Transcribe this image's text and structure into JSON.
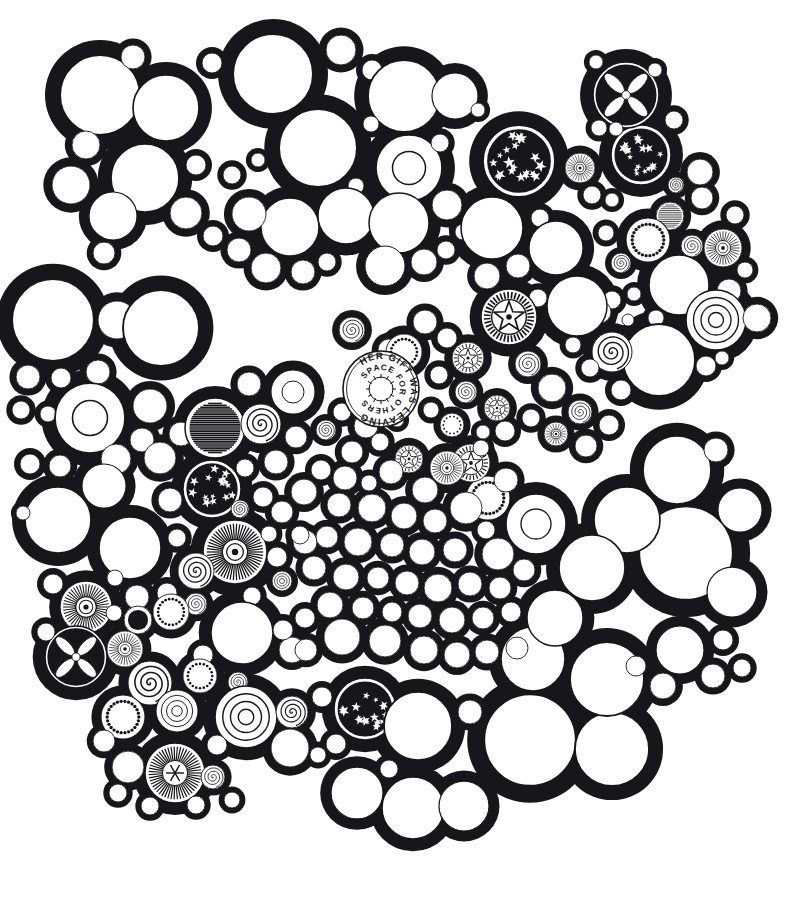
{
  "artwork": {
    "title": "Circle Packing Ink Drawing",
    "medium": "pen-and-ink",
    "background_color": "#ffffff",
    "ink_color": "#17161a",
    "canvas": {
      "width": 785,
      "height": 923
    },
    "hidden_text": {
      "outer_ring": "HER GIFT WAS LEAVING",
      "inner_ring": "SPACE FOR OTHERS",
      "full_phrase": "HER GIFT WAS LEAVING SPACE FOR OTHERS",
      "center_x": 381,
      "center_y": 389,
      "outer_radius": 30,
      "inner_radius": 19
    },
    "motif_names": [
      "plain-circle",
      "double-ring-circle",
      "concentric-rings",
      "spiral",
      "radial-sunburst",
      "star-field-circle",
      "flower-rosette",
      "five-point-star-medallion",
      "dotted-ring",
      "stippled-ring",
      "solid-black-disc",
      "asterisk-glyph",
      "hatched-circle"
    ]
  },
  "chart_data": {
    "type": "scatter",
    "xlabel": "",
    "ylabel": "",
    "xlim": [
      0,
      785
    ],
    "ylim": [
      0,
      923
    ],
    "grid": false,
    "legend": null,
    "note": "Each point is a packed circle: cx, cy, r in pixels, plus its decorative motif.",
    "fields": [
      "cx",
      "cy",
      "r",
      "motif"
    ],
    "circles": [
      [
        100,
        95,
        40,
        "plain"
      ],
      [
        166,
        108,
        33,
        "plain"
      ],
      [
        133,
        57,
        12,
        "plain"
      ],
      [
        212,
        63,
        10,
        "plain"
      ],
      [
        86,
        145,
        14,
        "plain"
      ],
      [
        145,
        178,
        34,
        "plain"
      ],
      [
        196,
        165,
        10,
        "plain"
      ],
      [
        71,
        185,
        19,
        "plain"
      ],
      [
        113,
        216,
        24,
        "plain"
      ],
      [
        186,
        213,
        16,
        "plain"
      ],
      [
        104,
        253,
        11,
        "plain"
      ],
      [
        273,
        74,
        40,
        "plain"
      ],
      [
        341,
        50,
        15,
        "plain"
      ],
      [
        318,
        148,
        39,
        "plain"
      ],
      [
        372,
        70,
        10,
        "plain"
      ],
      [
        404,
        96,
        36,
        "plain"
      ],
      [
        371,
        124,
        8,
        "plain"
      ],
      [
        409,
        168,
        33,
        "double"
      ],
      [
        455,
        96,
        23,
        "plain"
      ],
      [
        440,
        143,
        9,
        "plain"
      ],
      [
        478,
        110,
        7,
        "plain"
      ],
      [
        356,
        186,
        8,
        "plain"
      ],
      [
        290,
        227,
        29,
        "plain"
      ],
      [
        346,
        216,
        28,
        "plain"
      ],
      [
        249,
        214,
        17,
        "plain"
      ],
      [
        232,
        175,
        9,
        "plain"
      ],
      [
        258,
        160,
        7,
        "plain"
      ],
      [
        239,
        250,
        12,
        "plain"
      ],
      [
        213,
        236,
        10,
        "plain"
      ],
      [
        266,
        268,
        15,
        "plain"
      ],
      [
        303,
        272,
        12,
        "plain"
      ],
      [
        327,
        262,
        9,
        "plain"
      ],
      [
        399,
        223,
        30,
        "plain"
      ],
      [
        447,
        205,
        15,
        "plain"
      ],
      [
        385,
        266,
        20,
        "plain"
      ],
      [
        424,
        262,
        13,
        "plain"
      ],
      [
        446,
        250,
        9,
        "plain"
      ],
      [
        463,
        232,
        8,
        "plain"
      ],
      [
        492,
        228,
        31,
        "plain"
      ],
      [
        540,
        218,
        9,
        "plain"
      ],
      [
        556,
        248,
        27,
        "plain"
      ],
      [
        518,
        266,
        12,
        "plain"
      ],
      [
        487,
        276,
        13,
        "plain"
      ],
      [
        519,
        161,
        36,
        "star-field"
      ],
      [
        580,
        168,
        15,
        "radial-burst"
      ],
      [
        641,
        155,
        30,
        "star-field"
      ],
      [
        626,
        95,
        33,
        "flower-rosette"
      ],
      [
        599,
        128,
        8,
        "plain"
      ],
      [
        616,
        129,
        7,
        "plain"
      ],
      [
        674,
        120,
        9,
        "plain"
      ],
      [
        596,
        62,
        7,
        "plain"
      ],
      [
        655,
        70,
        7,
        "plain"
      ],
      [
        592,
        195,
        9,
        "plain"
      ],
      [
        612,
        200,
        7,
        "plain"
      ],
      [
        676,
        185,
        8,
        "spiral"
      ],
      [
        700,
        172,
        13,
        "plain"
      ],
      [
        702,
        198,
        11,
        "plain"
      ],
      [
        670,
        216,
        14,
        "hatched"
      ],
      [
        648,
        240,
        22,
        "dotted-ring"
      ],
      [
        692,
        246,
        11,
        "spiral"
      ],
      [
        723,
        248,
        19,
        "radial-burst"
      ],
      [
        735,
        215,
        9,
        "plain"
      ],
      [
        606,
        233,
        8,
        "plain"
      ],
      [
        621,
        263,
        10,
        "spiral"
      ],
      [
        679,
        285,
        30,
        "plain"
      ],
      [
        729,
        291,
        12,
        "plain"
      ],
      [
        745,
        270,
        8,
        "plain"
      ],
      [
        716,
        320,
        30,
        "concentric"
      ],
      [
        757,
        318,
        14,
        "plain"
      ],
      [
        612,
        300,
        9,
        "plain"
      ],
      [
        634,
        294,
        7,
        "plain"
      ],
      [
        656,
        318,
        8,
        "plain"
      ],
      [
        600,
        312,
        11,
        "plain"
      ],
      [
        628,
        320,
        6,
        "plain"
      ],
      [
        577,
        306,
        30,
        "plain"
      ],
      [
        538,
        298,
        9,
        "plain"
      ],
      [
        659,
        360,
        36,
        "plain"
      ],
      [
        706,
        366,
        10,
        "plain"
      ],
      [
        722,
        358,
        7,
        "plain"
      ],
      [
        612,
        352,
        20,
        "spiral"
      ],
      [
        621,
        390,
        10,
        "plain"
      ],
      [
        590,
        368,
        9,
        "plain"
      ],
      [
        573,
        345,
        8,
        "plain"
      ],
      [
        53,
        320,
        41,
        "plain"
      ],
      [
        117,
        320,
        19,
        "plain"
      ],
      [
        28,
        377,
        12,
        "plain"
      ],
      [
        61,
        378,
        10,
        "plain"
      ],
      [
        98,
        372,
        12,
        "plain"
      ],
      [
        161,
        328,
        38,
        "plain"
      ],
      [
        21,
        410,
        9,
        "plain"
      ],
      [
        48,
        414,
        8,
        "plain"
      ],
      [
        90,
        418,
        35,
        "double"
      ],
      [
        150,
        406,
        17,
        "plain"
      ],
      [
        142,
        440,
        12,
        "plain"
      ],
      [
        116,
        459,
        15,
        "plain"
      ],
      [
        30,
        464,
        10,
        "plain"
      ],
      [
        60,
        466,
        11,
        "plain"
      ],
      [
        58,
        520,
        33,
        "plain"
      ],
      [
        104,
        486,
        22,
        "plain"
      ],
      [
        23,
        513,
        7,
        "plain"
      ],
      [
        160,
        458,
        16,
        "plain"
      ],
      [
        181,
        434,
        12,
        "plain"
      ],
      [
        215,
        428,
        30,
        "hatched"
      ],
      [
        261,
        424,
        20,
        "spiral"
      ],
      [
        293,
        392,
        22,
        "double"
      ],
      [
        249,
        384,
        12,
        "plain"
      ],
      [
        296,
        437,
        11,
        "plain"
      ],
      [
        276,
        462,
        12,
        "plain"
      ],
      [
        245,
        468,
        9,
        "plain"
      ],
      [
        212,
        489,
        29,
        "star-field"
      ],
      [
        170,
        500,
        12,
        "plain"
      ],
      [
        263,
        497,
        10,
        "plain"
      ],
      [
        240,
        509,
        9,
        "spiral"
      ],
      [
        130,
        548,
        31,
        "plain"
      ],
      [
        177,
        538,
        9,
        "plain"
      ],
      [
        235,
        552,
        32,
        "radial-burst"
      ],
      [
        196,
        571,
        18,
        "spiral"
      ],
      [
        167,
        593,
        10,
        "plain"
      ],
      [
        196,
        604,
        11,
        "spiral"
      ],
      [
        277,
        557,
        10,
        "plain"
      ],
      [
        282,
        581,
        10,
        "concentric"
      ],
      [
        305,
        542,
        12,
        "plain"
      ],
      [
        252,
        596,
        9,
        "plain"
      ],
      [
        86,
        607,
        26,
        "radial-burst"
      ],
      [
        137,
        597,
        12,
        "plain"
      ],
      [
        138,
        620,
        14,
        "solid-black"
      ],
      [
        171,
        612,
        18,
        "dotted-ring"
      ],
      [
        53,
        584,
        10,
        "plain"
      ],
      [
        115,
        578,
        8,
        "plain"
      ],
      [
        76,
        657,
        31,
        "flower-rosette"
      ],
      [
        125,
        649,
        18,
        "radial-burst"
      ],
      [
        46,
        632,
        9,
        "plain"
      ],
      [
        114,
        613,
        8,
        "plain"
      ],
      [
        242,
        633,
        31,
        "plain"
      ],
      [
        292,
        650,
        13,
        "plain"
      ],
      [
        203,
        655,
        10,
        "plain"
      ],
      [
        150,
        683,
        22,
        "spiral"
      ],
      [
        200,
        676,
        17,
        "dotted-ring"
      ],
      [
        238,
        682,
        10,
        "spiral"
      ],
      [
        123,
        717,
        22,
        "dotted-ring"
      ],
      [
        177,
        711,
        21,
        "concentric"
      ],
      [
        246,
        717,
        31,
        "concentric"
      ],
      [
        292,
        712,
        16,
        "spiral"
      ],
      [
        290,
        748,
        19,
        "plain"
      ],
      [
        217,
        745,
        10,
        "plain"
      ],
      [
        175,
        773,
        30,
        "asterisk"
      ],
      [
        128,
        767,
        16,
        "plain"
      ],
      [
        104,
        741,
        11,
        "plain"
      ],
      [
        213,
        777,
        12,
        "spiral"
      ],
      [
        150,
        806,
        9,
        "plain"
      ],
      [
        196,
        805,
        9,
        "plain"
      ],
      [
        232,
        800,
        8,
        "plain"
      ],
      [
        118,
        793,
        9,
        "plain"
      ],
      [
        365,
        709,
        31,
        "star-field"
      ],
      [
        322,
        697,
        10,
        "plain"
      ],
      [
        336,
        744,
        10,
        "plain"
      ],
      [
        318,
        755,
        8,
        "plain"
      ],
      [
        418,
        726,
        34,
        "plain"
      ],
      [
        470,
        712,
        12,
        "plain"
      ],
      [
        357,
        793,
        26,
        "plain"
      ],
      [
        413,
        808,
        31,
        "plain"
      ],
      [
        464,
        806,
        25,
        "plain"
      ],
      [
        389,
        769,
        9,
        "plain"
      ],
      [
        530,
        740,
        46,
        "plain"
      ],
      [
        612,
        749,
        37,
        "plain"
      ],
      [
        607,
        679,
        37,
        "plain"
      ],
      [
        533,
        659,
        32,
        "plain"
      ],
      [
        680,
        650,
        24,
        "plain"
      ],
      [
        723,
        640,
        10,
        "plain"
      ],
      [
        742,
        668,
        9,
        "plain"
      ],
      [
        713,
        676,
        12,
        "plain"
      ],
      [
        663,
        686,
        13,
        "plain"
      ],
      [
        636,
        666,
        10,
        "plain"
      ],
      [
        686,
        553,
        47,
        "plain"
      ],
      [
        740,
        510,
        22,
        "plain"
      ],
      [
        732,
        592,
        25,
        "plain"
      ],
      [
        677,
        470,
        34,
        "plain"
      ],
      [
        627,
        520,
        33,
        "plain"
      ],
      [
        716,
        450,
        12,
        "plain"
      ],
      [
        592,
        568,
        33,
        "plain"
      ],
      [
        555,
        618,
        28,
        "plain"
      ],
      [
        536,
        524,
        30,
        "double"
      ],
      [
        488,
        498,
        22,
        "dotted-ring"
      ],
      [
        498,
        554,
        16,
        "plain"
      ],
      [
        471,
        463,
        19,
        "star-medallion"
      ],
      [
        509,
        317,
        28,
        "star-medallion"
      ],
      [
        468,
        358,
        16,
        "star-medallion"
      ],
      [
        497,
        408,
        13,
        "star-medallion"
      ],
      [
        409,
        459,
        14,
        "star-medallion"
      ],
      [
        389,
        350,
        11,
        "plain"
      ],
      [
        352,
        330,
        13,
        "spiral"
      ],
      [
        404,
        352,
        18,
        "dotted-ring"
      ],
      [
        425,
        322,
        12,
        "plain"
      ],
      [
        447,
        338,
        10,
        "plain"
      ],
      [
        439,
        375,
        9,
        "plain"
      ],
      [
        466,
        392,
        11,
        "spiral"
      ],
      [
        528,
        364,
        13,
        "spiral"
      ],
      [
        552,
        388,
        14,
        "plain"
      ],
      [
        580,
        412,
        12,
        "spiral"
      ],
      [
        609,
        425,
        10,
        "plain"
      ],
      [
        586,
        446,
        11,
        "plain"
      ],
      [
        556,
        434,
        12,
        "radial-burst"
      ],
      [
        531,
        418,
        9,
        "plain"
      ],
      [
        505,
        431,
        10,
        "plain"
      ],
      [
        483,
        432,
        7,
        "plain"
      ],
      [
        452,
        425,
        12,
        "dotted-ring"
      ],
      [
        431,
        410,
        8,
        "plain"
      ],
      [
        366,
        426,
        12,
        "plain"
      ],
      [
        342,
        412,
        9,
        "plain"
      ],
      [
        326,
        430,
        10,
        "spiral"
      ],
      [
        352,
        452,
        11,
        "plain"
      ],
      [
        380,
        442,
        9,
        "plain"
      ],
      [
        397,
        420,
        7,
        "plain"
      ],
      [
        447,
        468,
        17,
        "radial-burst"
      ],
      [
        425,
        490,
        13,
        "plain"
      ],
      [
        481,
        448,
        8,
        "plain"
      ],
      [
        391,
        472,
        12,
        "plain"
      ],
      [
        369,
        483,
        8,
        "plain"
      ],
      [
        345,
        478,
        12,
        "plain"
      ],
      [
        321,
        470,
        10,
        "plain"
      ],
      [
        304,
        492,
        13,
        "plain"
      ],
      [
        339,
        505,
        12,
        "plain"
      ],
      [
        372,
        508,
        14,
        "plain"
      ],
      [
        404,
        516,
        13,
        "plain"
      ],
      [
        435,
        521,
        12,
        "plain"
      ],
      [
        466,
        508,
        16,
        "plain"
      ],
      [
        506,
        480,
        12,
        "plain"
      ],
      [
        282,
        512,
        11,
        "plain"
      ],
      [
        300,
        535,
        9,
        "plain"
      ],
      [
        327,
        537,
        11,
        "plain"
      ],
      [
        358,
        542,
        14,
        "plain"
      ],
      [
        392,
        545,
        12,
        "plain"
      ],
      [
        422,
        552,
        13,
        "plain"
      ],
      [
        455,
        550,
        12,
        "plain"
      ],
      [
        486,
        530,
        9,
        "plain"
      ],
      [
        269,
        534,
        8,
        "plain"
      ],
      [
        314,
        568,
        12,
        "plain"
      ],
      [
        346,
        577,
        13,
        "plain"
      ],
      [
        378,
        578,
        11,
        "plain"
      ],
      [
        407,
        583,
        12,
        "plain"
      ],
      [
        438,
        588,
        14,
        "plain"
      ],
      [
        470,
        584,
        12,
        "plain"
      ],
      [
        500,
        588,
        11,
        "plain"
      ],
      [
        524,
        570,
        11,
        "plain"
      ],
      [
        247,
        630,
        0,
        "plain"
      ],
      [
        330,
        605,
        13,
        "plain"
      ],
      [
        363,
        608,
        11,
        "plain"
      ],
      [
        392,
        612,
        10,
        "plain"
      ],
      [
        420,
        616,
        12,
        "plain"
      ],
      [
        452,
        620,
        13,
        "plain"
      ],
      [
        483,
        618,
        11,
        "plain"
      ],
      [
        511,
        612,
        10,
        "plain"
      ],
      [
        305,
        618,
        10,
        "plain"
      ],
      [
        342,
        637,
        18,
        "plain"
      ],
      [
        385,
        641,
        16,
        "plain"
      ],
      [
        424,
        650,
        14,
        "plain"
      ],
      [
        457,
        655,
        13,
        "plain"
      ],
      [
        487,
        652,
        12,
        "plain"
      ],
      [
        517,
        648,
        11,
        "plain"
      ],
      [
        306,
        650,
        11,
        "plain"
      ],
      [
        283,
        630,
        10,
        "plain"
      ]
    ]
  }
}
